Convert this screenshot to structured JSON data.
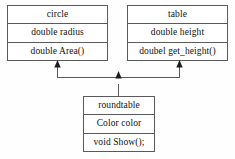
{
  "diagram": {
    "type": "uml-class-diagram",
    "title": "",
    "background_color": "#fefefe",
    "line_color": "#5a5a5a",
    "text_color": "#111111",
    "classes": [
      {
        "id": "circle",
        "name": "circle",
        "attribute": "double radius",
        "operation": "double Area()",
        "position": {
          "x": 7,
          "y": 5,
          "width": 101,
          "height": 56
        }
      },
      {
        "id": "table",
        "name": "table",
        "attribute": "double height",
        "operation": "doubel get_height()",
        "position": {
          "x": 127,
          "y": 5,
          "width": 101,
          "height": 56
        }
      },
      {
        "id": "roundtable",
        "name": "roundtable",
        "attribute": "Color color",
        "operation": "void Show();",
        "position": {
          "x": 83,
          "y": 96,
          "width": 72,
          "height": 56
        }
      }
    ],
    "relationships": [
      {
        "kind": "inheritance",
        "from": "roundtable",
        "to": "circle",
        "arrow": "filled-triangle-up"
      },
      {
        "kind": "inheritance",
        "from": "roundtable",
        "to": "table",
        "arrow": "filled-triangle-up"
      }
    ]
  }
}
